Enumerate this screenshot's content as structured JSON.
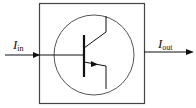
{
  "diagram": {
    "type": "transistor-block",
    "input_label": {
      "main": "I",
      "sub": "in"
    },
    "output_label": {
      "main": "I",
      "sub": "out"
    },
    "component": "NPN bipolar junction transistor",
    "colors": {
      "stroke": "#111111",
      "box": "#444444",
      "background": "#ffffff"
    }
  }
}
